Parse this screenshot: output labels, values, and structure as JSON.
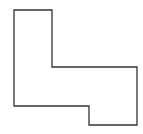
{
  "diagram": {
    "shape": "rectilinear-polygon",
    "stroke_color": "#333333",
    "fill_color": "#ffffff",
    "stroke_width": 1.3,
    "points": "14,10 52,10 52,67 137,67 137,125 89,125 89,106 14,106"
  }
}
